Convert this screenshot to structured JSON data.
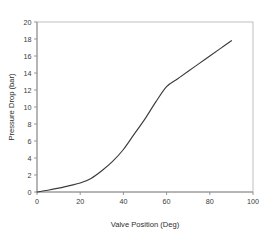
{
  "chart_data": {
    "type": "line",
    "title": "",
    "xlabel": "Valve Position (Deg)",
    "ylabel": "Pressure Drop (bar)",
    "xlim": [
      0,
      100
    ],
    "ylim": [
      0,
      20
    ],
    "xticks": [
      0,
      20,
      40,
      60,
      80,
      100
    ],
    "yticks": [
      0,
      2,
      4,
      6,
      8,
      10,
      12,
      14,
      16,
      18,
      20
    ],
    "xtick_labels": [
      "0",
      "20",
      "40",
      "60",
      "80",
      "100"
    ],
    "ytick_labels": [
      "0",
      "2",
      "4",
      "6",
      "8",
      "10",
      "12",
      "14",
      "16",
      "18",
      "20"
    ],
    "grid": false,
    "legend": false,
    "legend_position": "none",
    "line_color": "#3b3b3b",
    "frame_color": "#b9b9b9",
    "background_color": "#ffffff",
    "series": [
      {
        "name": "Pressure Drop",
        "x": [
          0,
          5,
          10,
          15,
          20,
          25,
          30,
          35,
          40,
          45,
          50,
          55,
          60,
          65,
          70,
          75,
          80,
          85,
          90
        ],
        "values": [
          0.0,
          0.2,
          0.45,
          0.75,
          1.05,
          1.6,
          2.5,
          3.6,
          5.0,
          6.8,
          8.6,
          10.6,
          12.4,
          13.3,
          14.2,
          15.1,
          16.0,
          16.9,
          17.8
        ]
      }
    ]
  },
  "axis": {
    "x_title": "Valve Position (Deg)",
    "y_title": "Pressure Drop (bar)"
  }
}
